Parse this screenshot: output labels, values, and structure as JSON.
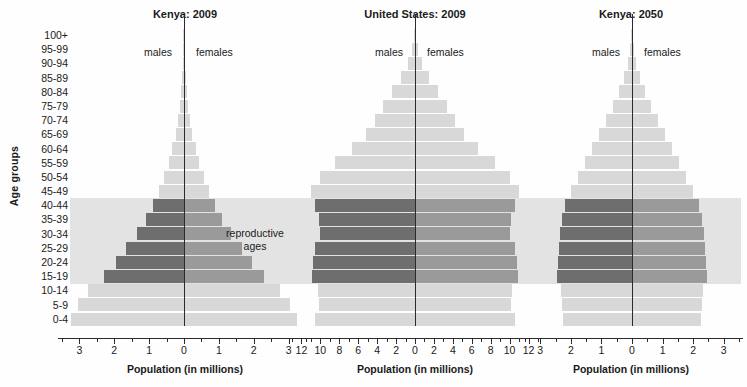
{
  "figure": {
    "y_axis_label": "Age groups",
    "x_axis_label": "Population (in millions)",
    "male_label": "males",
    "female_label": "females",
    "repro_label_line1": "reproductive",
    "repro_label_line2": "ages"
  },
  "colors": {
    "bar_light": "#d8d8d8",
    "bar_male_repro": "#6e6e6e",
    "bar_female_repro": "#9a9a9a",
    "band": "#e3e3e3",
    "axis": "#2b2b2b",
    "text": "#1a1a1a",
    "background": "#fefefe"
  },
  "age_groups": [
    "100+",
    "95-99",
    "90-94",
    "85-89",
    "80-84",
    "75-79",
    "70-74",
    "65-69",
    "60-64",
    "55-59",
    "50-54",
    "45-49",
    "40-44",
    "35-39",
    "30-34",
    "25-29",
    "20-24",
    "15-19",
    "10-14",
    "5-9",
    "0-4"
  ],
  "reproductive_age_groups": [
    "40-44",
    "35-39",
    "30-34",
    "25-29",
    "20-24",
    "15-19"
  ],
  "chart_data": [
    {
      "type": "bar",
      "title": "Kenya:  2009",
      "xlabel": "Population (in millions)",
      "ylabel": "Age groups",
      "xlim": [
        -3.5,
        3.5
      ],
      "tick_labels": [
        "3",
        "2",
        "1",
        "0",
        "1",
        "2",
        "3"
      ],
      "tick_values": [
        -3,
        -2,
        -1,
        0,
        1,
        2,
        3
      ],
      "minor_tick_step": 0.5,
      "grid": false,
      "categories": [
        "100+",
        "95-99",
        "90-94",
        "85-89",
        "80-84",
        "75-79",
        "70-74",
        "65-69",
        "60-64",
        "55-59",
        "50-54",
        "45-49",
        "40-44",
        "35-39",
        "30-34",
        "25-29",
        "20-24",
        "15-19",
        "10-14",
        "5-9",
        "0-4"
      ],
      "series": [
        {
          "name": "males",
          "values": [
            0.01,
            0.02,
            0.03,
            0.05,
            0.08,
            0.12,
            0.17,
            0.24,
            0.33,
            0.44,
            0.57,
            0.72,
            0.9,
            1.1,
            1.35,
            1.65,
            1.95,
            2.3,
            2.75,
            3.05,
            3.25
          ]
        },
        {
          "name": "females",
          "values": [
            0.01,
            0.02,
            0.03,
            0.05,
            0.08,
            0.12,
            0.17,
            0.24,
            0.33,
            0.44,
            0.57,
            0.72,
            0.9,
            1.1,
            1.35,
            1.65,
            1.95,
            2.3,
            2.75,
            3.05,
            3.25
          ]
        }
      ]
    },
    {
      "type": "bar",
      "title": "United States:  2009",
      "xlabel": "Population (in millions)",
      "ylabel": "Age groups",
      "xlim": [
        -13,
        13
      ],
      "tick_labels": [
        "12",
        "10",
        "8",
        "6",
        "4",
        "2",
        "0",
        "2",
        "4",
        "6",
        "8",
        "10",
        "12"
      ],
      "tick_values": [
        -12,
        -10,
        -8,
        -6,
        -4,
        -2,
        0,
        2,
        4,
        6,
        8,
        10,
        12
      ],
      "minor_tick_step": 1,
      "grid": false,
      "categories": [
        "100+",
        "95-99",
        "90-94",
        "85-89",
        "80-84",
        "75-79",
        "70-74",
        "65-69",
        "60-64",
        "55-59",
        "50-54",
        "45-49",
        "40-44",
        "35-39",
        "30-34",
        "25-29",
        "20-24",
        "15-19",
        "10-14",
        "5-9",
        "0-4"
      ],
      "series": [
        {
          "name": "males",
          "values": [
            0.05,
            0.35,
            0.75,
            1.5,
            2.4,
            3.4,
            4.2,
            5.2,
            6.7,
            8.5,
            10.0,
            11.0,
            10.6,
            10.1,
            10.0,
            10.6,
            10.8,
            10.9,
            10.3,
            10.1,
            10.6
          ]
        },
        {
          "name": "females",
          "values": [
            0.05,
            0.35,
            0.75,
            1.5,
            2.4,
            3.4,
            4.2,
            5.2,
            6.7,
            8.5,
            10.0,
            11.0,
            10.6,
            10.1,
            10.0,
            10.6,
            10.8,
            10.9,
            10.3,
            10.1,
            10.6
          ]
        }
      ]
    },
    {
      "type": "bar",
      "title": "Kenya:  2050",
      "xlabel": "Population (in millions)",
      "ylabel": "Age groups",
      "xlim": [
        -3.5,
        3.5
      ],
      "tick_labels": [
        "3",
        "2",
        "1",
        "0",
        "1",
        "2",
        "3"
      ],
      "tick_values": [
        -3,
        -2,
        -1,
        0,
        1,
        2,
        3
      ],
      "minor_tick_step": 0.5,
      "grid": false,
      "categories": [
        "100+",
        "95-99",
        "90-94",
        "85-89",
        "80-84",
        "75-79",
        "70-74",
        "65-69",
        "60-64",
        "55-59",
        "50-54",
        "45-49",
        "40-44",
        "35-39",
        "30-34",
        "25-29",
        "20-24",
        "15-19",
        "10-14",
        "5-9",
        "0-4"
      ],
      "series": [
        {
          "name": "males",
          "values": [
            0.02,
            0.05,
            0.12,
            0.25,
            0.42,
            0.62,
            0.85,
            1.08,
            1.32,
            1.55,
            1.78,
            2.0,
            2.2,
            2.28,
            2.34,
            2.38,
            2.42,
            2.44,
            2.32,
            2.28,
            2.26
          ]
        },
        {
          "name": "females",
          "values": [
            0.02,
            0.05,
            0.12,
            0.25,
            0.42,
            0.62,
            0.85,
            1.08,
            1.32,
            1.55,
            1.78,
            2.0,
            2.2,
            2.28,
            2.34,
            2.38,
            2.42,
            2.44,
            2.32,
            2.28,
            2.26
          ]
        }
      ]
    }
  ]
}
